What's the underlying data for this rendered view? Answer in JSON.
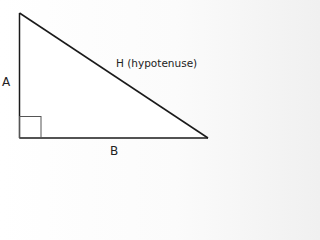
{
  "diagram": {
    "type": "right-triangle",
    "labels": {
      "side_a": "A",
      "side_b": "B",
      "hypotenuse": "H (hypotenuse)"
    },
    "right_angle_marker": true,
    "colors": {
      "stroke": "#1a1a1a",
      "marker": "#555555",
      "text": "#222222"
    }
  }
}
